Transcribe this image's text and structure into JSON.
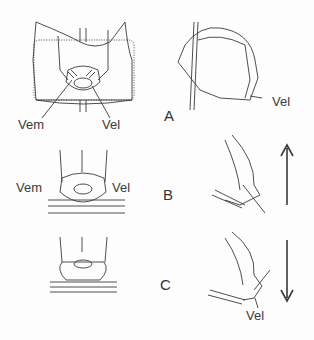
{
  "labels": {
    "panelA": {
      "letter": "A",
      "vem": "Vem",
      "vel_front": "Vel",
      "vel_side": "Vel"
    },
    "panelB": {
      "letter": "B",
      "vem": "Vem",
      "vel": "Vel"
    },
    "panelC": {
      "letter": "C",
      "vel": "Vel"
    }
  },
  "arrows": {
    "B": "up",
    "C": "down"
  },
  "colors": {
    "line": "#3a3a3a",
    "background": "#fdfdfd"
  }
}
